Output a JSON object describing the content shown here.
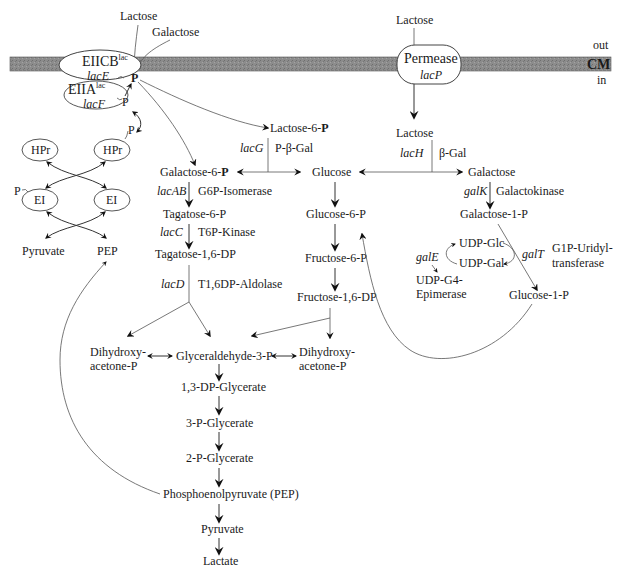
{
  "membrane": {
    "out_label": "out",
    "cm_label": "CM",
    "in_label": "in",
    "color": "#8a8a8a"
  },
  "pts": {
    "lactose_out": "Lactose",
    "galactose_out": "Galactose",
    "eiicb": "EIICB",
    "eiicb_sup": "lac",
    "lacE": "lacE",
    "eiia": "EIIA",
    "eiia_sup": "lac",
    "lacF": "lacF",
    "p1": "P",
    "p2": "P",
    "p3": "P",
    "p4": "P",
    "hpr_left": "HPr",
    "hpr_right": "HPr",
    "ei_left": "EI",
    "ei_right": "EI",
    "pyruvate": "Pyruvate",
    "pep": "PEP"
  },
  "permease": {
    "lactose_out": "Lactose",
    "name": "Permease",
    "gene": "lacP",
    "lactose_in": "Lactose"
  },
  "tagatose_pathway": {
    "lactose6p_prefix": "Lactose-6-",
    "lactose6p_p": "P",
    "lacG": "lacG",
    "pbgal": "P-β-Gal",
    "galactose6p_prefix": "Galactose-6-",
    "galactose6p_p": "P",
    "lacAB": "lacAB",
    "g6p_isomerase": "G6P-Isomerase",
    "tagatose6p": "Tagatose-6-P",
    "lacC": "lacC",
    "t6p_kinase": "T6P-Kinase",
    "tagatose16dp": "Tagatose-1,6-DP",
    "lacD": "lacD",
    "t16dp_aldolase": "T1,6DP-Aldolase"
  },
  "glucose_branch": {
    "glucose": "Glucose",
    "glucose6p": "Glucose-6-P",
    "fructose6p": "Fructose-6-P",
    "fructose16dp": "Fructose-1,6-DP"
  },
  "leloir_pathway": {
    "lacH": "lacH",
    "bgal": "β-Gal",
    "galactose": "Galactose",
    "galK": "galK",
    "galactokinase": "Galactokinase",
    "galactose1p": "Galactose-1-P",
    "udp_glc": "UDP-Glc",
    "udp_gal": "UDP-Gal",
    "galE": "galE",
    "galT": "galT",
    "g1p_uridyl_1": "G1P-Uridyl-",
    "g1p_uridyl_2": "transferase",
    "udp_g4_1": "UDP-G4-",
    "udp_g4_2": "Epimerase",
    "glucose1p": "Glucose-1-P"
  },
  "glycolysis": {
    "dhap_left_1": "Dihydroxy-",
    "dhap_left_2": "acetone-P",
    "gap": "Glyceraldehyde-3-P",
    "dhap_right_1": "Dihydroxy-",
    "dhap_right_2": "acetone-P",
    "bpg13": "1,3-DP-Glycerate",
    "pg3": "3-P-Glycerate",
    "pg2": "2-P-Glycerate",
    "pep": "Phosphoenolpyruvate (PEP)",
    "pyruvate": "Pyruvate",
    "lactate": "Lactate"
  }
}
